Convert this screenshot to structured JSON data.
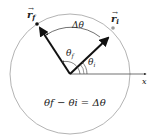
{
  "diagram": {
    "vector_final": "r",
    "vector_final_sub": "f",
    "vector_initial": "r",
    "vector_initial_sub": "i",
    "delta_theta": "Δθ",
    "theta_f": "θ",
    "theta_f_sub": "f",
    "theta_i": "θ",
    "theta_i_sub": "i",
    "axis_label": "x",
    "equation": "θf − θi = Δθ",
    "circle_color": "#a0a0a0",
    "vector_color": "#111111"
  }
}
